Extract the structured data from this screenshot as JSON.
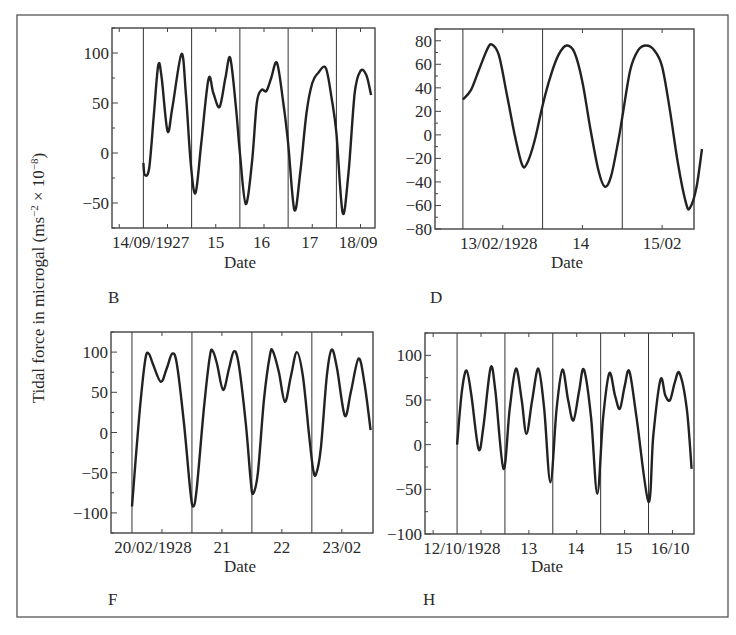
{
  "figure": {
    "ylabel_main": "Tidal force in microgal (ms",
    "ylabel_exp1": "−2",
    "ylabel_mid": " × 10",
    "ylabel_exp2": "−8",
    "ylabel_end": ")",
    "line_color": "#222222",
    "frame_color": "#444444"
  },
  "chart_data": [
    {
      "panel": "B",
      "type": "line",
      "xlabel": "Date",
      "ylabel": "Tidal force in microgal (ms−2 × 10−8)",
      "ylim": [
        -75,
        125
      ],
      "yticks": [
        100,
        50,
        0,
        -50
      ],
      "ytick_labels": [
        "100",
        "50",
        "0",
        "−50"
      ],
      "xlim_days": [
        -0.65,
        4.8
      ],
      "day_lines": [
        0,
        1,
        2,
        3,
        4
      ],
      "xtick_labels": [
        {
          "label": "14/09/1927",
          "day": 0.15
        },
        {
          "label": "15",
          "day": 1.5
        },
        {
          "label": "16",
          "day": 2.45
        },
        {
          "label": "17",
          "day": 3.45
        },
        {
          "label": "18/09",
          "day": 4.45
        }
      ],
      "points": [
        [
          0.0,
          -10
        ],
        [
          0.03,
          -22
        ],
        [
          0.12,
          -15
        ],
        [
          0.22,
          40
        ],
        [
          0.31,
          88
        ],
        [
          0.38,
          75
        ],
        [
          0.5,
          22
        ],
        [
          0.6,
          45
        ],
        [
          0.79,
          99
        ],
        [
          0.88,
          60
        ],
        [
          0.98,
          -10
        ],
        [
          1.08,
          -40
        ],
        [
          1.2,
          10
        ],
        [
          1.35,
          74
        ],
        [
          1.45,
          60
        ],
        [
          1.58,
          46
        ],
        [
          1.7,
          75
        ],
        [
          1.8,
          95
        ],
        [
          1.92,
          45
        ],
        [
          2.0,
          0
        ],
        [
          2.12,
          -51
        ],
        [
          2.25,
          -10
        ],
        [
          2.35,
          50
        ],
        [
          2.45,
          63
        ],
        [
          2.55,
          62
        ],
        [
          2.65,
          75
        ],
        [
          2.77,
          90
        ],
        [
          2.9,
          50
        ],
        [
          3.0,
          10
        ],
        [
          3.13,
          -57
        ],
        [
          3.25,
          -20
        ],
        [
          3.38,
          40
        ],
        [
          3.5,
          70
        ],
        [
          3.62,
          80
        ],
        [
          3.78,
          85
        ],
        [
          3.9,
          55
        ],
        [
          4.0,
          20
        ],
        [
          4.13,
          -60
        ],
        [
          4.25,
          -20
        ],
        [
          4.38,
          60
        ],
        [
          4.5,
          82
        ],
        [
          4.62,
          78
        ],
        [
          4.72,
          58
        ]
      ],
      "xlabel_text": "Date"
    },
    {
      "panel": "D",
      "type": "line",
      "xlabel": "Date",
      "ylim": [
        -80,
        90
      ],
      "yticks": [
        80,
        60,
        40,
        20,
        0,
        -20,
        -40,
        -60,
        -80
      ],
      "ytick_labels": [
        "80",
        "60",
        "40",
        "20",
        "0",
        "−20",
        "−40",
        "−60",
        "−80"
      ],
      "xlim_days": [
        -0.35,
        2.9
      ],
      "day_lines": [
        0,
        1,
        2
      ],
      "xtick_labels": [
        {
          "label": "13/02/1928",
          "day": 0.45
        },
        {
          "label": "14",
          "day": 1.48
        },
        {
          "label": "15/02",
          "day": 2.5
        }
      ],
      "points": [
        [
          0.0,
          30
        ],
        [
          0.1,
          38
        ],
        [
          0.2,
          55
        ],
        [
          0.3,
          72
        ],
        [
          0.36,
          77
        ],
        [
          0.45,
          68
        ],
        [
          0.55,
          35
        ],
        [
          0.65,
          0
        ],
        [
          0.74,
          -25
        ],
        [
          0.8,
          -25
        ],
        [
          0.9,
          -5
        ],
        [
          1.0,
          25
        ],
        [
          1.1,
          50
        ],
        [
          1.2,
          68
        ],
        [
          1.3,
          76
        ],
        [
          1.4,
          70
        ],
        [
          1.5,
          45
        ],
        [
          1.6,
          5
        ],
        [
          1.7,
          -30
        ],
        [
          1.78,
          -44
        ],
        [
          1.86,
          -35
        ],
        [
          1.95,
          -5
        ],
        [
          2.0,
          15
        ],
        [
          2.1,
          55
        ],
        [
          2.2,
          72
        ],
        [
          2.3,
          76
        ],
        [
          2.4,
          72
        ],
        [
          2.5,
          58
        ],
        [
          2.6,
          20
        ],
        [
          2.7,
          -25
        ],
        [
          2.8,
          -58
        ],
        [
          2.85,
          -62
        ],
        [
          2.93,
          -45
        ],
        [
          3.0,
          -12
        ]
      ],
      "xlabel_text": "Date"
    },
    {
      "panel": "F",
      "type": "line",
      "xlabel": "Date",
      "ylim": [
        -125,
        125
      ],
      "yticks": [
        100,
        50,
        0,
        -50,
        -100
      ],
      "ytick_labels": [
        "100",
        "50",
        "0",
        "−50",
        "−100"
      ],
      "xlim_days": [
        -0.35,
        4.02
      ],
      "day_lines": [
        0,
        1,
        2,
        3
      ],
      "xtick_labels": [
        {
          "label": "20/02/1928",
          "day": 0.35
        },
        {
          "label": "21",
          "day": 1.5
        },
        {
          "label": "22",
          "day": 2.5
        },
        {
          "label": "23/02",
          "day": 3.5
        }
      ],
      "points": [
        [
          0.0,
          -92
        ],
        [
          0.12,
          20
        ],
        [
          0.22,
          90
        ],
        [
          0.28,
          98
        ],
        [
          0.35,
          85
        ],
        [
          0.48,
          63
        ],
        [
          0.58,
          80
        ],
        [
          0.67,
          98
        ],
        [
          0.75,
          85
        ],
        [
          0.87,
          10
        ],
        [
          0.97,
          -70
        ],
        [
          1.02,
          -92
        ],
        [
          1.08,
          -70
        ],
        [
          1.2,
          30
        ],
        [
          1.3,
          95
        ],
        [
          1.35,
          101
        ],
        [
          1.42,
          85
        ],
        [
          1.52,
          53
        ],
        [
          1.62,
          80
        ],
        [
          1.7,
          101
        ],
        [
          1.78,
          85
        ],
        [
          1.9,
          10
        ],
        [
          1.98,
          -60
        ],
        [
          2.02,
          -76
        ],
        [
          2.1,
          -50
        ],
        [
          2.2,
          40
        ],
        [
          2.3,
          96
        ],
        [
          2.35,
          101
        ],
        [
          2.45,
          75
        ],
        [
          2.55,
          38
        ],
        [
          2.65,
          70
        ],
        [
          2.75,
          100
        ],
        [
          2.85,
          70
        ],
        [
          2.95,
          0
        ],
        [
          3.02,
          -45
        ],
        [
          3.07,
          -52
        ],
        [
          3.15,
          -20
        ],
        [
          3.25,
          70
        ],
        [
          3.33,
          103
        ],
        [
          3.42,
          80
        ],
        [
          3.55,
          21
        ],
        [
          3.65,
          50
        ],
        [
          3.78,
          92
        ],
        [
          3.88,
          60
        ],
        [
          3.98,
          3
        ]
      ],
      "xlabel_text": "Date"
    },
    {
      "panel": "H",
      "type": "line",
      "xlabel": "Date",
      "ylim": [
        -100,
        125
      ],
      "yticks": [
        100,
        50,
        0,
        -50,
        -100
      ],
      "ytick_labels": [
        "100",
        "50",
        "0",
        "−50",
        "−100"
      ],
      "xlim_days": [
        -0.67,
        4.95
      ],
      "day_lines": [
        0,
        1,
        2,
        3,
        4
      ],
      "xtick_labels": [
        {
          "label": "12/10/1928",
          "day": 0.1
        },
        {
          "label": "13",
          "day": 1.5
        },
        {
          "label": "14",
          "day": 2.48
        },
        {
          "label": "15",
          "day": 3.48
        },
        {
          "label": "16/10",
          "day": 4.45
        }
      ],
      "points": [
        [
          0.0,
          0
        ],
        [
          0.1,
          60
        ],
        [
          0.2,
          83
        ],
        [
          0.3,
          55
        ],
        [
          0.45,
          -5
        ],
        [
          0.55,
          20
        ],
        [
          0.7,
          86
        ],
        [
          0.8,
          60
        ],
        [
          0.97,
          -27
        ],
        [
          1.1,
          40
        ],
        [
          1.23,
          85
        ],
        [
          1.35,
          50
        ],
        [
          1.45,
          12
        ],
        [
          1.57,
          50
        ],
        [
          1.7,
          85
        ],
        [
          1.82,
          40
        ],
        [
          1.95,
          -42
        ],
        [
          2.08,
          40
        ],
        [
          2.2,
          84
        ],
        [
          2.32,
          50
        ],
        [
          2.43,
          27
        ],
        [
          2.55,
          60
        ],
        [
          2.65,
          84
        ],
        [
          2.8,
          30
        ],
        [
          2.93,
          -55
        ],
        [
          3.05,
          30
        ],
        [
          3.18,
          80
        ],
        [
          3.3,
          55
        ],
        [
          3.4,
          40
        ],
        [
          3.5,
          65
        ],
        [
          3.6,
          82
        ],
        [
          3.75,
          30
        ],
        [
          4.0,
          -64
        ],
        [
          4.1,
          10
        ],
        [
          4.25,
          73
        ],
        [
          4.35,
          55
        ],
        [
          4.45,
          50
        ],
        [
          4.55,
          70
        ],
        [
          4.65,
          80
        ],
        [
          4.8,
          40
        ],
        [
          4.9,
          -27
        ]
      ],
      "xlabel_text": "Date"
    }
  ],
  "panels_layout_px": [
    {
      "panel": "B",
      "frame": [
        112,
        28,
        375,
        228
      ],
      "letter_pos": [
        108,
        303
      ],
      "date_pos": [
        240,
        268
      ]
    },
    {
      "panel": "D",
      "frame": [
        435,
        29,
        694,
        229
      ],
      "letter_pos": [
        430,
        303
      ],
      "date_pos": [
        567,
        268
      ]
    },
    {
      "panel": "F",
      "frame": [
        111,
        332,
        373,
        533
      ],
      "letter_pos": [
        108,
        605
      ],
      "date_pos": [
        240,
        572
      ]
    },
    {
      "panel": "H",
      "frame": [
        425,
        333,
        694,
        534
      ],
      "letter_pos": [
        423,
        605
      ],
      "date_pos": [
        547,
        572
      ]
    }
  ]
}
